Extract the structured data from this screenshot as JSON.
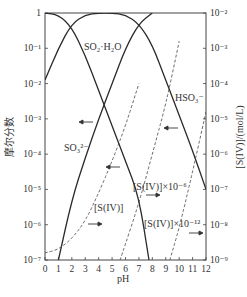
{
  "chart_data": {
    "type": "line",
    "title": "",
    "xlabel": "pH",
    "ylabel_left": "摩尔分数",
    "ylabel_right": "[S(IV)]/(mol/L)",
    "x_ticks": [
      "0",
      "1",
      "2",
      "3",
      "4",
      "5",
      "6",
      "7",
      "8",
      "9",
      "10",
      "11",
      "12"
    ],
    "xlim": [
      0,
      12
    ],
    "y_left_ticks": [
      "1",
      "10⁻¹",
      "10⁻²",
      "10⁻³",
      "10⁻⁴",
      "10⁻⁵",
      "10⁻⁶",
      "10⁻⁷"
    ],
    "y_left_range": [
      1e-07,
      1
    ],
    "y_right_ticks": [
      "10⁻²",
      "10⁻³",
      "10⁻⁴",
      "10⁻⁵",
      "10⁻⁶",
      "10⁻⁷",
      "10⁻⁸",
      "10⁻⁹"
    ],
    "y_right_range": [
      1e-09,
      0.01
    ],
    "scale": "log",
    "series": [
      {
        "name": "SO₂·H₂O",
        "axis": "left",
        "style": "solid",
        "x": [
          0,
          1,
          2,
          3,
          4,
          5,
          6,
          7,
          7.75
        ],
        "log_y": [
          0,
          -0.05,
          -0.4,
          -1.2,
          -2.2,
          -3.2,
          -4.2,
          -5.2,
          -7
        ]
      },
      {
        "name": "HSO₃⁻",
        "axis": "left",
        "style": "solid",
        "x": [
          0,
          1,
          2,
          3,
          4,
          5,
          6,
          7,
          8,
          9,
          10,
          11,
          12
        ],
        "log_y": [
          -1.9,
          -1.0,
          -0.3,
          -0.05,
          0,
          0,
          -0.05,
          -0.3,
          -0.9,
          -1.9,
          -2.9,
          -3.9,
          -5.0
        ]
      },
      {
        "name": "SO₃²⁻",
        "axis": "left",
        "style": "solid",
        "x": [
          1,
          2,
          3,
          4,
          5,
          6,
          7,
          8
        ],
        "log_y": [
          -7,
          -5.3,
          -4.1,
          -3.0,
          -2.0,
          -1.0,
          -0.3,
          0
        ]
      },
      {
        "name": "[S(IV)]",
        "axis": "right",
        "style": "dashed",
        "x": [
          0,
          1,
          2,
          3,
          4,
          5,
          6,
          7
        ],
        "log_y": [
          -8.8,
          -8.7,
          -8.4,
          -7.9,
          -7.1,
          -6.2,
          -5.2,
          -4.0
        ]
      },
      {
        "name": "[S(IV)]×10⁻⁶",
        "axis": "right",
        "style": "dashed",
        "x": [
          5.6,
          7,
          8,
          9,
          10
        ],
        "log_y": [
          -9,
          -7.4,
          -6.0,
          -4.6,
          -2.8
        ]
      },
      {
        "name": "[S(IV)]×10⁻¹²",
        "axis": "right",
        "style": "dashed",
        "x": [
          9.3,
          10,
          11,
          12
        ],
        "log_y": [
          -9,
          -8.1,
          -6.5,
          -4.8
        ]
      }
    ],
    "annotations": [
      {
        "text": "SO₂·H₂O",
        "x_px": 83,
        "y_px": 47
      },
      {
        "text": "HSO₃⁻",
        "x_px": 175,
        "y_px": 98
      },
      {
        "text": "SO₃²⁻",
        "x_px": 64,
        "y_px": 148
      },
      {
        "text": "[S(IV)]",
        "x_px": 93,
        "y_px": 182
      },
      {
        "text": "[S(IV)]×10⁻⁶",
        "x_px": 133,
        "y_px": 186
      },
      {
        "text": "[S(IV)]×10⁻¹²",
        "x_px": 142,
        "y_px": 223
      }
    ],
    "grid": false,
    "legend": "none"
  }
}
